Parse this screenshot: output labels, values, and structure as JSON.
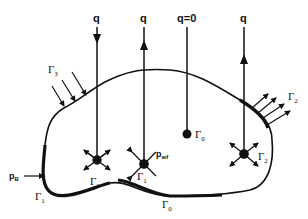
{
  "diagram": {
    "flux_labels": [
      {
        "id": "q1",
        "text": "q",
        "direction": "down"
      },
      {
        "id": "q2",
        "text": "q",
        "direction": "up"
      },
      {
        "id": "q0",
        "text": "q=0",
        "direction": "none"
      },
      {
        "id": "q3",
        "text": "q",
        "direction": "up"
      }
    ],
    "boundary_labels": {
      "gamma3_top": {
        "sym": "Γ",
        "sub": "3"
      },
      "gamma2_right": {
        "sym": "Γ",
        "sub": "2"
      },
      "gamma1_left": {
        "sym": "Γ",
        "sub": "1"
      },
      "gamma0_bottom": {
        "sym": "Γ",
        "sub": "0"
      }
    },
    "well_labels": {
      "well_gamma3": {
        "sym": "Γ",
        "sub": "3"
      },
      "well_gamma1": {
        "sym": "Γ",
        "sub": "1"
      },
      "well_gamma0": {
        "sym": "Γ",
        "sub": "0"
      },
      "well_gamma2": {
        "sym": "Γ",
        "sub": "2"
      }
    },
    "pressure_labels": {
      "boundary_pressure": {
        "text": "p",
        "sub": "B"
      },
      "well_pressure": {
        "text": "p",
        "sub": "wf"
      }
    }
  }
}
